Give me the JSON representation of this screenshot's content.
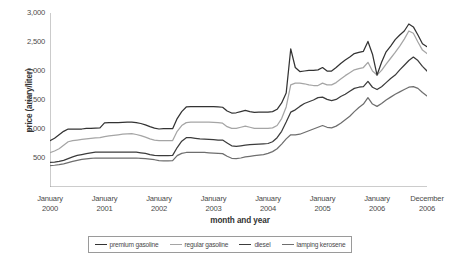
{
  "chart_data": {
    "type": "line",
    "title": "",
    "xlabel": "month and year",
    "ylabel": "price (ariary/liter)",
    "ylim": [
      0,
      3000
    ],
    "yticks": [
      500,
      1000,
      1500,
      2000,
      2500,
      3000
    ],
    "ytick_labels": [
      "500",
      "1,000",
      "1,500",
      "2,000",
      "2,500",
      "3,000"
    ],
    "grid": false,
    "legend_position": "bottom",
    "x_tick_labels": [
      {
        "line1": "January",
        "line2": "2000"
      },
      {
        "line1": "January",
        "line2": "2001"
      },
      {
        "line1": "January",
        "line2": "2002"
      },
      {
        "line1": "January",
        "line2": "2003"
      },
      {
        "line1": "January",
        "line2": "2004"
      },
      {
        "line1": "January",
        "line2": "2005"
      },
      {
        "line1": "January",
        "line2": "2006"
      },
      {
        "line1": "December",
        "line2": "2006"
      }
    ],
    "x_index_range": [
      0,
      83
    ],
    "x_tick_indices": [
      0,
      12,
      24,
      36,
      48,
      60,
      72,
      83
    ],
    "series": [
      {
        "name": "premium gasoline",
        "color": "#333333",
        "values": [
          800,
          840,
          900,
          960,
          1000,
          1000,
          1000,
          1000,
          1010,
          1010,
          1015,
          1020,
          1105,
          1110,
          1110,
          1110,
          1115,
          1120,
          1120,
          1110,
          1095,
          1070,
          1040,
          1015,
          1000,
          1005,
          1005,
          1005,
          1180,
          1300,
          1380,
          1385,
          1385,
          1385,
          1385,
          1385,
          1385,
          1380,
          1375,
          1310,
          1275,
          1280,
          1300,
          1320,
          1300,
          1285,
          1290,
          1290,
          1290,
          1300,
          1340,
          1450,
          1620,
          2380,
          2060,
          1990,
          2000,
          2010,
          2010,
          2020,
          2060,
          2000,
          2000,
          2060,
          2130,
          2190,
          2240,
          2300,
          2320,
          2340,
          2510,
          2290,
          1930,
          2150,
          2330,
          2430,
          2540,
          2620,
          2690,
          2810,
          2760,
          2620,
          2470,
          2420
        ]
      },
      {
        "name": "regular gasoline",
        "color": "#a5a5a5",
        "values": [
          590,
          620,
          660,
          720,
          780,
          800,
          810,
          820,
          830,
          840,
          845,
          850,
          870,
          880,
          890,
          900,
          910,
          915,
          920,
          905,
          885,
          860,
          830,
          810,
          800,
          800,
          800,
          800,
          960,
          1060,
          1110,
          1120,
          1120,
          1120,
          1120,
          1120,
          1115,
          1110,
          1100,
          1040,
          1010,
          1010,
          1030,
          1050,
          1030,
          1010,
          1010,
          1010,
          1010,
          1020,
          1060,
          1180,
          1380,
          1760,
          1790,
          1790,
          1780,
          1760,
          1750,
          1750,
          1790,
          1760,
          1760,
          1800,
          1860,
          1920,
          1970,
          2020,
          2040,
          2060,
          2150,
          2000,
          1930,
          2010,
          2120,
          2220,
          2320,
          2430,
          2550,
          2690,
          2650,
          2500,
          2360,
          2300
        ]
      },
      {
        "name": "diesel",
        "color": "#3c3c3c",
        "values": [
          425,
          430,
          440,
          460,
          490,
          520,
          545,
          560,
          575,
          590,
          600,
          600,
          600,
          600,
          600,
          600,
          600,
          600,
          600,
          600,
          590,
          580,
          560,
          545,
          540,
          540,
          540,
          545,
          680,
          790,
          850,
          850,
          840,
          830,
          825,
          820,
          815,
          810,
          810,
          760,
          710,
          700,
          710,
          720,
          730,
          735,
          740,
          745,
          750,
          780,
          850,
          960,
          1120,
          1290,
          1330,
          1390,
          1440,
          1470,
          1500,
          1540,
          1550,
          1510,
          1490,
          1510,
          1560,
          1600,
          1650,
          1700,
          1720,
          1730,
          1820,
          1720,
          1680,
          1730,
          1800,
          1870,
          1930,
          2020,
          2100,
          2180,
          2240,
          2180,
          2080,
          2000
        ]
      },
      {
        "name": "lamping kerosene",
        "color": "#6e6e6e",
        "values": [
          370,
          375,
          385,
          400,
          420,
          440,
          460,
          475,
          485,
          495,
          500,
          500,
          500,
          500,
          500,
          500,
          500,
          500,
          500,
          500,
          495,
          490,
          480,
          470,
          455,
          450,
          450,
          455,
          540,
          580,
          595,
          595,
          595,
          595,
          595,
          590,
          585,
          580,
          575,
          530,
          495,
          490,
          500,
          520,
          530,
          540,
          550,
          560,
          580,
          610,
          660,
          740,
          830,
          900,
          900,
          910,
          940,
          970,
          1000,
          1030,
          1060,
          1030,
          1020,
          1050,
          1100,
          1160,
          1220,
          1300,
          1370,
          1430,
          1540,
          1430,
          1390,
          1440,
          1500,
          1550,
          1600,
          1640,
          1680,
          1720,
          1730,
          1700,
          1630,
          1570
        ]
      }
    ]
  },
  "axis_color": "#8c8c8c",
  "legend": {
    "items": [
      {
        "label": "premium gasoline",
        "color": "#333333"
      },
      {
        "label": "regular gasoline",
        "color": "#a5a5a5"
      },
      {
        "label": "diesel",
        "color": "#3c3c3c"
      },
      {
        "label": "lamping kerosene",
        "color": "#6e6e6e"
      }
    ]
  }
}
